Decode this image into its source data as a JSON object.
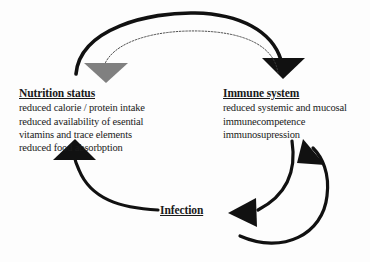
{
  "figure": {
    "type": "cycle-diagram",
    "background_color": "#fdfdfd",
    "text_color": "#1a1a1a",
    "width": 370,
    "height": 262
  },
  "nodes": {
    "nutrition": {
      "title": "Nutrition status",
      "lines": [
        "reduced calorie / protein intake",
        "reduced availability of esential",
        "vitamins and trace elements",
        "reduced food absorbption"
      ]
    },
    "immune": {
      "title": "Immune system",
      "lines": [
        "reduced systemic and mucosal",
        "immunecompetence",
        "immunosupression"
      ]
    },
    "infection": {
      "title": "Infection",
      "lines": []
    }
  },
  "arrows": [
    {
      "name": "nutrition-to-immune-outer",
      "from": "Nutrition status",
      "to": "Immune system",
      "style": "thick-solid-arc",
      "color": "#111111",
      "head_color": "#111111",
      "position": "top"
    },
    {
      "name": "immune-to-nutrition-inner",
      "from": "Immune system",
      "to": "Nutrition status",
      "style": "thin-dotted-arc",
      "color": "#3a3a3a",
      "head_color": "#808080",
      "position": "top-inner"
    },
    {
      "name": "immune-to-infection",
      "from": "Immune system",
      "to": "Infection",
      "style": "thick-solid-arc",
      "color": "#111111",
      "head_color": "#111111",
      "position": "right-inner"
    },
    {
      "name": "infection-to-immune",
      "from": "Infection",
      "to": "Immune system",
      "style": "thick-solid-arc",
      "color": "#111111",
      "head_color": "#111111",
      "position": "right-outer"
    },
    {
      "name": "infection-to-nutrition",
      "from": "Infection",
      "to": "Nutrition status",
      "style": "thick-solid-arc",
      "color": "#111111",
      "head_color": "#111111",
      "position": "bottom-left"
    }
  ],
  "colors": {
    "stroke_black": "#111111",
    "stroke_gray": "#808080",
    "stroke_thin": "#3a3a3a",
    "background": "#fdfdfd"
  }
}
